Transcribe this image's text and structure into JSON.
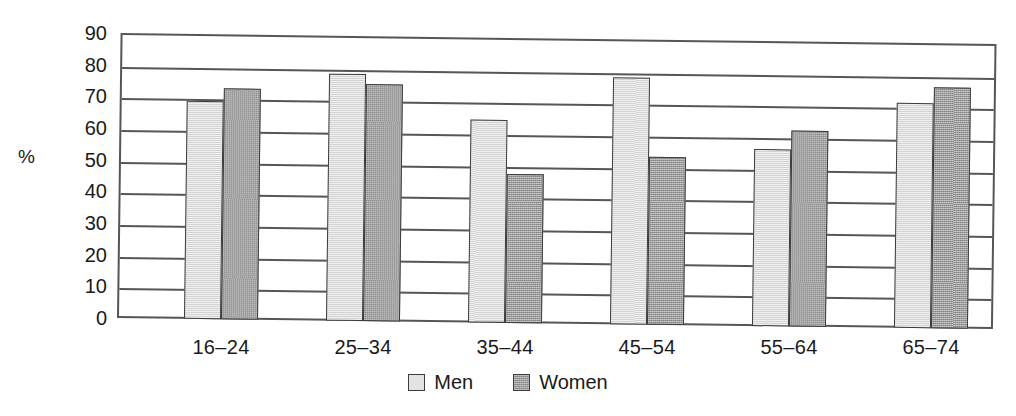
{
  "chart_data": {
    "type": "bar",
    "title": "",
    "xlabel": "",
    "ylabel": "%",
    "ylim": [
      0,
      90
    ],
    "ytick_step": 10,
    "yticks": [
      "90",
      "80",
      "70",
      "60",
      "50",
      "40",
      "30",
      "20",
      "10",
      "0"
    ],
    "grid": true,
    "legend_position": "bottom-center",
    "categories": [
      "16–24",
      "25–34",
      "35–44",
      "45–54",
      "55–64",
      "65–74"
    ],
    "series": [
      {
        "name": "Men",
        "values": [
          69,
          78,
          64,
          78,
          56,
          71
        ]
      },
      {
        "name": "Women",
        "values": [
          73,
          75,
          47,
          53,
          62,
          76
        ]
      }
    ],
    "colors": {
      "men": "#dedede",
      "women": "#9b9b9b",
      "axis": "#55565a",
      "bar_outline": "#3b3c3f",
      "text": "#1a1a1a",
      "background": "#ffffff"
    }
  },
  "legend": {
    "items": [
      {
        "label": "Men"
      },
      {
        "label": "Women"
      }
    ]
  }
}
